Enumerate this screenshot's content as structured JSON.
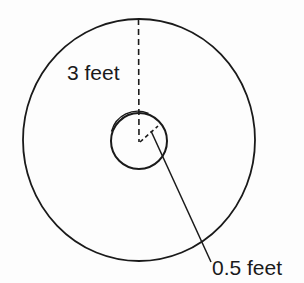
{
  "diagram": {
    "type": "concentric-circles",
    "outer_circle": {
      "radius_label": "3 feet",
      "radius_value": 3,
      "unit": "feet"
    },
    "inner_circle": {
      "radius_label": "0.5 feet",
      "radius_value": 0.5,
      "unit": "feet"
    },
    "stroke_color": "#1a1a1a",
    "background_color": "#ffffff"
  }
}
